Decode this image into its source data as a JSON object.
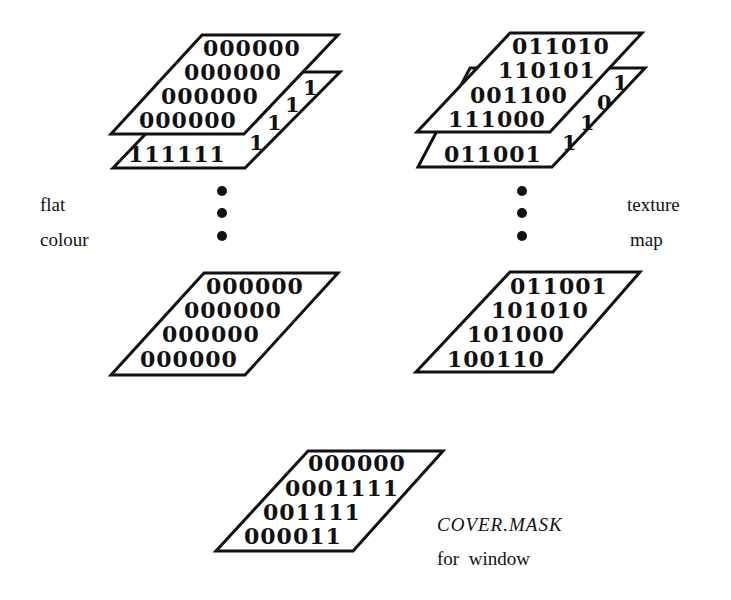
{
  "diagram": {
    "flat_colour_stack": {
      "label_line1": "flat",
      "label_line2": "colour",
      "top_plane": {
        "rows": [
          "000000",
          "000000",
          "000000",
          "000000"
        ]
      },
      "second_plane": {
        "bottom_row": "111111",
        "edge_bits": [
          "1",
          "1",
          "1",
          "1"
        ]
      },
      "last_plane": {
        "rows": [
          "000000",
          "000000",
          "000000",
          "000000"
        ]
      }
    },
    "texture_map_stack": {
      "label_line1": "texture",
      "label_line2": "map",
      "top_plane": {
        "rows": [
          "011010",
          "110101",
          "001100",
          "111000"
        ]
      },
      "second_plane": {
        "bottom_row": "011001",
        "edge_bits": [
          "1",
          "1",
          "0",
          "1"
        ]
      },
      "last_plane": {
        "rows": [
          "011001",
          "101010",
          "101000",
          "100110"
        ]
      }
    },
    "cover_mask": {
      "title": "COVER.MASK",
      "subtitle": "for  window",
      "rows": [
        "000000",
        "0001111",
        "001111",
        "000011"
      ]
    },
    "ellipsis_dots": 3
  }
}
